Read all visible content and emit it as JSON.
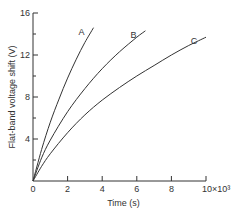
{
  "chart_data": {
    "type": "line",
    "title": "",
    "xlabel": "Time (s)",
    "ylabel": "Flat-band voltage shift (V)",
    "xlim": [
      0,
      10
    ],
    "ylim": [
      0,
      16
    ],
    "x_multiplier_label": "10×10³",
    "x_ticks": [
      0,
      2,
      4,
      6,
      8,
      10
    ],
    "x_tick_labels": [
      "0",
      "2",
      "4",
      "6",
      "8",
      "10×10³"
    ],
    "y_ticks": [
      0,
      4,
      8,
      12,
      16
    ],
    "y_tick_labels": [
      "",
      "4",
      "8",
      "12",
      "16"
    ],
    "y_minor_ticks": [
      2,
      6,
      10,
      14
    ],
    "grid": false,
    "legend": "inline-labels",
    "series": [
      {
        "name": "A",
        "x": [
          0,
          0.5,
          1.0,
          1.5,
          2.0,
          2.5,
          3.0,
          3.5
        ],
        "y": [
          0,
          3.0,
          5.6,
          7.8,
          9.8,
          11.6,
          13.2,
          14.6
        ]
      },
      {
        "name": "B",
        "x": [
          0,
          0.5,
          1.0,
          2.0,
          3.0,
          4.0,
          5.0,
          6.0,
          6.5
        ],
        "y": [
          0,
          2.2,
          3.9,
          6.6,
          8.8,
          10.7,
          12.3,
          13.7,
          14.3
        ]
      },
      {
        "name": "C",
        "x": [
          0,
          0.5,
          1.0,
          2.0,
          3.0,
          4.0,
          5.0,
          6.0,
          7.0,
          8.0,
          9.0,
          10.0
        ],
        "y": [
          0,
          1.4,
          2.6,
          4.6,
          6.3,
          7.7,
          8.9,
          10.0,
          11.0,
          12.0,
          12.9,
          13.7
        ]
      }
    ]
  }
}
